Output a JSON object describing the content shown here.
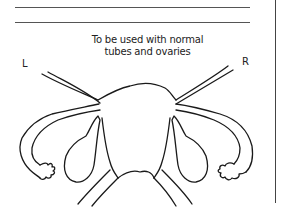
{
  "form": {
    "lines": 2
  },
  "caption": {
    "line1": "To be used with normal",
    "line2": "tubes and ovaries"
  },
  "labels": {
    "left": "L",
    "right": "R"
  },
  "diagram": {
    "stroke_color": "#1a1a1a"
  }
}
